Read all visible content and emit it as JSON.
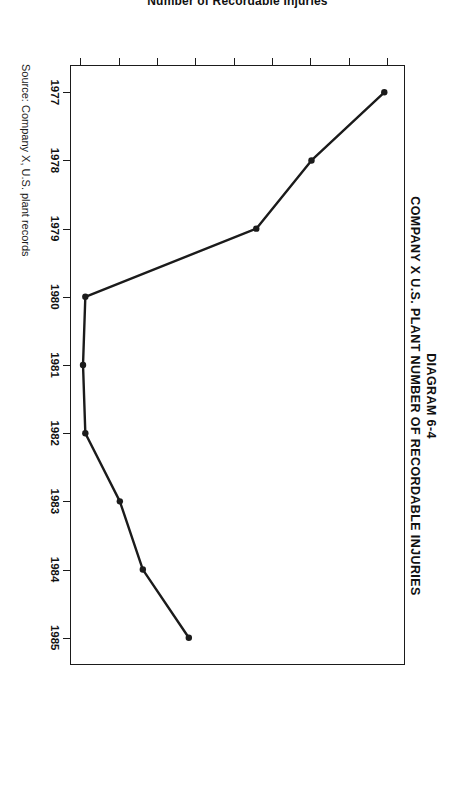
{
  "figure": {
    "title_line1": "DIAGRAM 6-4",
    "title_line2": "COMPANY X U.S. PLANT NUMBER OF RECORDABLE INJURIES",
    "source_note": "Source: Company X, U.S. plant records",
    "orientation": "rotated-90-clockwise",
    "ink_color": "#1b1b1b",
    "paper_color": "#ffffff"
  },
  "chart_data": {
    "type": "line",
    "title": "COMPANY X U.S. PLANT NUMBER OF RECORDABLE INJURIES",
    "subtitle": "DIAGRAM 6-4",
    "xlabel": "",
    "ylabel": "Number of Recordable Injuries",
    "categories": [
      "1977",
      "1978",
      "1979",
      "1980",
      "1981",
      "1982",
      "1983",
      "1984",
      "1985"
    ],
    "x": [
      1977,
      1978,
      1979,
      1980,
      1981,
      1982,
      1983,
      1984,
      1985
    ],
    "values": [
      545,
      450,
      378,
      155,
      152,
      155,
      200,
      230,
      290
    ],
    "series": [
      {
        "name": "Number of Recordable Injuries",
        "values": [
          545,
          450,
          378,
          155,
          152,
          155,
          200,
          230,
          290
        ]
      }
    ],
    "xlim": [
      1976.6,
      1985.4
    ],
    "ylim": [
      135,
      572
    ],
    "ytick_labels": [
      "150",
      "200",
      "250",
      "300",
      "350",
      "400",
      "450",
      "500",
      "550"
    ],
    "yticks": [
      150,
      200,
      250,
      300,
      350,
      400,
      450,
      500,
      550
    ],
    "xtick_labels": [
      "1977",
      "1978",
      "1979",
      "1980",
      "1981",
      "1982",
      "1983",
      "1984",
      "1985"
    ],
    "grid": false,
    "legend": false,
    "markers": "filled-dot",
    "line_color": "#1b1b1b",
    "marker_color": "#1b1b1b"
  }
}
